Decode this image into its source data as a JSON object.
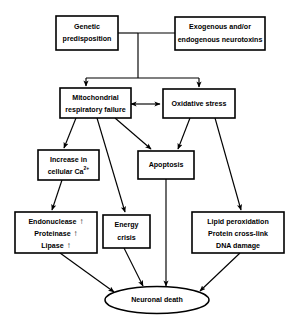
{
  "figure": {
    "type": "flowchart",
    "background_color": "#ffffff",
    "line_color": "#000000"
  },
  "nodes": {
    "genetic_predisposition": {
      "shape": "rectangle",
      "line1": "Genetic",
      "line2": "predisposition"
    },
    "neurotoxins": {
      "shape": "rectangle",
      "line1": "Exogenous and/or",
      "line2": "endogenous neurotoxins"
    },
    "mitochondrial_failure": {
      "shape": "rectangle",
      "line1": "Mitochondrial",
      "line2": "respiratory failure"
    },
    "oxidative_stress": {
      "shape": "rectangle",
      "line1": "Oxidative stress"
    },
    "calcium_increase": {
      "shape": "rectangle",
      "line1": "Increase in",
      "line2_pre": "cellular Ca",
      "line2_sup": "2+"
    },
    "apoptosis": {
      "shape": "rectangle",
      "line1": "Apoptosis"
    },
    "enzymes": {
      "shape": "rectangle",
      "line1": "Endonuclease",
      "line2": "Proteinase",
      "line3": "Lipase",
      "arrow_glyph": "↑"
    },
    "energy_crisis": {
      "shape": "rectangle",
      "line1": "Energy",
      "line2": "crisis"
    },
    "damage": {
      "shape": "rectangle",
      "line1": "Lipid peroxidation",
      "line2": "Protein cross-link",
      "line3": "DNA damage"
    },
    "neuronal_death": {
      "shape": "ellipse",
      "line1": "Neuronal death"
    }
  },
  "edges": [
    {
      "from": "genetic_predisposition",
      "to": "junction",
      "arrowhead": false
    },
    {
      "from": "neurotoxins",
      "to": "junction",
      "arrowhead": false
    },
    {
      "from": "junction",
      "to": "mitochondrial_failure",
      "arrowhead": true
    },
    {
      "from": "junction",
      "to": "oxidative_stress",
      "arrowhead": true
    },
    {
      "from": "mitochondrial_failure",
      "to": "oxidative_stress",
      "arrowhead": "both"
    },
    {
      "from": "mitochondrial_failure",
      "to": "calcium_increase",
      "arrowhead": true
    },
    {
      "from": "mitochondrial_failure",
      "to": "energy_crisis",
      "arrowhead": true
    },
    {
      "from": "mitochondrial_failure",
      "to": "apoptosis",
      "arrowhead": true
    },
    {
      "from": "oxidative_stress",
      "to": "apoptosis",
      "arrowhead": true
    },
    {
      "from": "oxidative_stress",
      "to": "damage",
      "arrowhead": true
    },
    {
      "from": "calcium_increase",
      "to": "enzymes",
      "arrowhead": true
    },
    {
      "from": "enzymes",
      "to": "neuronal_death",
      "arrowhead": true
    },
    {
      "from": "energy_crisis",
      "to": "neuronal_death",
      "arrowhead": true
    },
    {
      "from": "apoptosis",
      "to": "neuronal_death",
      "arrowhead": true
    },
    {
      "from": "damage",
      "to": "neuronal_death",
      "arrowhead": true
    }
  ]
}
